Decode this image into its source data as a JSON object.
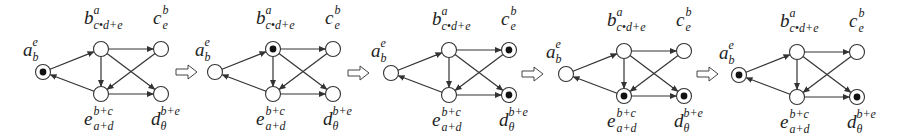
{
  "diagram": {
    "title": "",
    "node_labels": {
      "a": {
        "base": "a",
        "sup": "e",
        "sub": "b"
      },
      "b": {
        "base": "b",
        "sup": "a",
        "sub": "c•d+e"
      },
      "c": {
        "base": "c",
        "sup": "b",
        "sub": "e"
      },
      "d": {
        "base": "d",
        "sup": "b+e",
        "sub": "θ"
      },
      "e": {
        "base": "e",
        "sup": "b+c",
        "sub": "a+d"
      }
    },
    "edges": [
      {
        "from": "a",
        "to": "b"
      },
      {
        "from": "e",
        "to": "a"
      },
      {
        "from": "b",
        "to": "c"
      },
      {
        "from": "b",
        "to": "e"
      },
      {
        "from": "b",
        "to": "d"
      },
      {
        "from": "c",
        "to": "e"
      },
      {
        "from": "e",
        "to": "d"
      }
    ],
    "panels": [
      {
        "id": 1,
        "marked_nodes": [
          "a"
        ],
        "offset": 0
      },
      {
        "id": 2,
        "marked_nodes": [
          "b"
        ],
        "offset": 172
      },
      {
        "id": 3,
        "marked_nodes": [
          "c",
          "d"
        ],
        "offset": 348
      },
      {
        "id": 4,
        "marked_nodes": [
          "e",
          "d"
        ],
        "offset": 523
      },
      {
        "id": 5,
        "marked_nodes": [
          "a",
          "d"
        ],
        "offset": 696
      }
    ],
    "transition_arrows": [
      {
        "x": 176,
        "y": 72
      },
      {
        "x": 348,
        "y": 73
      },
      {
        "x": 522,
        "y": 74
      },
      {
        "x": 697,
        "y": 74
      }
    ],
    "arrow_glyph": "⇨",
    "colors": {
      "stroke": "#333333",
      "token": "#111111",
      "background": "#ffffff"
    }
  }
}
